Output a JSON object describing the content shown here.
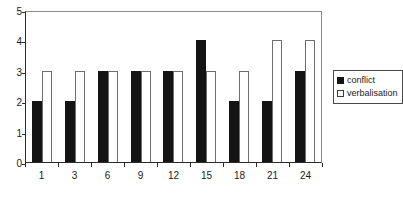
{
  "chart_data": {
    "type": "bar",
    "title": "",
    "subtitle": "",
    "xlabel": "",
    "ylabel": "",
    "categories": [
      "1",
      "3",
      "6",
      "9",
      "12",
      "15",
      "18",
      "21",
      "24"
    ],
    "series": [
      {
        "name": "conflict",
        "color": "#141414",
        "fill": "solid",
        "values": [
          2,
          2,
          3,
          3,
          3,
          4,
          2,
          2,
          3
        ]
      },
      {
        "name": "verbalisation",
        "color": "#ffffff",
        "fill": "hollow",
        "values": [
          3,
          3,
          3,
          3,
          3,
          3,
          3,
          4,
          4
        ]
      }
    ],
    "ylim": [
      0,
      5
    ],
    "ytick_labels": [
      "0",
      "1",
      "2",
      "3",
      "4",
      "5"
    ],
    "ytick_values": [
      0,
      1,
      2,
      3,
      4,
      5
    ],
    "grid": false,
    "legend_position": "right",
    "legend_entries": [
      "conflict",
      "verbalisation"
    ]
  }
}
